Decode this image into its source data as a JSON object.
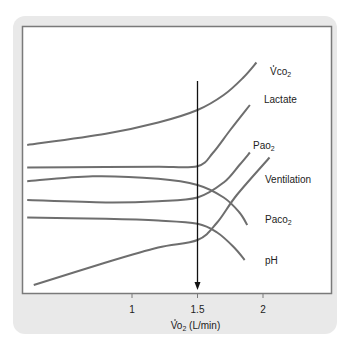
{
  "chart_data": {
    "type": "line",
    "title": "",
    "xlabel": "V̇O₂ (L/min)",
    "xlabel_main": "Vo",
    "xlabel_sub": "2",
    "xlabel_rest": " (L/min)",
    "ylabel": "",
    "xlim": [
      0.2,
      2.6
    ],
    "ylim": [
      0,
      10
    ],
    "x_ticks": [
      1,
      1.5,
      2
    ],
    "x_tick_labels": [
      "1",
      "1.5",
      "2"
    ],
    "grid": false,
    "threshold": {
      "x": 1.5,
      "label": "anaerobic threshold",
      "style": "vertical-arrow-down"
    },
    "colors": {
      "curve": "#6e6e6e",
      "threshold": "#111111",
      "frame": "#7a7a7a",
      "panel": "#e9e9e9"
    },
    "series": [
      {
        "name": "VCO2",
        "label_main": "Vco",
        "label_sub": "2",
        "label_dot": true,
        "points": [
          [
            0.2,
            5.8
          ],
          [
            0.8,
            6.25
          ],
          [
            1.2,
            6.7
          ],
          [
            1.5,
            7.2
          ],
          [
            1.7,
            7.8
          ],
          [
            1.85,
            8.5
          ],
          [
            1.95,
            9.1
          ]
        ]
      },
      {
        "name": "Lactate",
        "label_main": "Lactate",
        "label_sub": "",
        "points": [
          [
            0.2,
            4.9
          ],
          [
            0.8,
            4.92
          ],
          [
            1.2,
            4.93
          ],
          [
            1.5,
            4.95
          ],
          [
            1.62,
            5.5
          ],
          [
            1.75,
            6.4
          ],
          [
            1.9,
            7.4
          ]
        ]
      },
      {
        "name": "PaCO2",
        "label_main": "Paco",
        "label_sub": "2",
        "points": [
          [
            0.2,
            4.35
          ],
          [
            0.7,
            4.55
          ],
          [
            1.2,
            4.45
          ],
          [
            1.5,
            4.2
          ],
          [
            1.7,
            3.7
          ],
          [
            1.82,
            3.1
          ],
          [
            1.88,
            2.6
          ]
        ]
      },
      {
        "name": "PaO2",
        "label_main": "Pao",
        "label_sub": "2",
        "points": [
          [
            0.2,
            3.6
          ],
          [
            0.8,
            3.5
          ],
          [
            1.2,
            3.55
          ],
          [
            1.5,
            3.7
          ],
          [
            1.7,
            4.3
          ],
          [
            1.82,
            5.0
          ],
          [
            1.9,
            5.5
          ]
        ]
      },
      {
        "name": "pH",
        "label_main": "pH",
        "label_sub": "",
        "points": [
          [
            0.2,
            2.9
          ],
          [
            0.8,
            2.85
          ],
          [
            1.2,
            2.78
          ],
          [
            1.5,
            2.65
          ],
          [
            1.65,
            2.3
          ],
          [
            1.78,
            1.7
          ],
          [
            1.86,
            1.2
          ]
        ]
      },
      {
        "name": "Ventilation",
        "label_main": "Ventilation",
        "label_sub": "",
        "points": [
          [
            0.25,
            0.2
          ],
          [
            0.8,
            1.1
          ],
          [
            1.2,
            1.7
          ],
          [
            1.5,
            2.0
          ],
          [
            1.65,
            2.7
          ],
          [
            1.8,
            3.8
          ],
          [
            2.05,
            5.3
          ]
        ]
      }
    ]
  }
}
